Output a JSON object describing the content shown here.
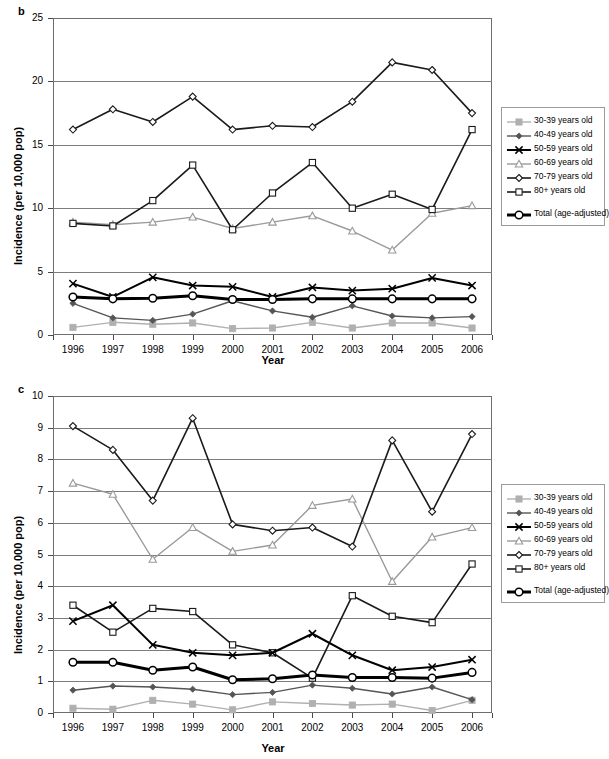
{
  "figure": {
    "panels": [
      {
        "letter": "b",
        "ylabel": "Incidence (per 10,000 pop)",
        "xlabel": "Year",
        "yticks": [
          "25",
          "20",
          "15",
          "10",
          "5",
          "0"
        ],
        "xticks": [
          "1996",
          "1997",
          "1998",
          "1999",
          "2000",
          "2001",
          "2002",
          "2003",
          "2004",
          "2005",
          "2006"
        ]
      },
      {
        "letter": "c",
        "ylabel": "Incidence (per 10,000 pop)",
        "xlabel": "Year",
        "yticks": [
          "10",
          "9",
          "8",
          "7",
          "6",
          "5",
          "4",
          "3",
          "2",
          "1",
          "0"
        ],
        "xticks": [
          "1996",
          "1997",
          "1998",
          "1999",
          "2000",
          "2001",
          "2002",
          "2003",
          "2004",
          "2005",
          "2006"
        ]
      }
    ],
    "legend": {
      "entries": [
        {
          "label": "30-39 years old",
          "marker": "filled-square",
          "color": "#b0b0b0",
          "width": 1.4
        },
        {
          "label": "40-49 years old",
          "marker": "filled-diamond",
          "color": "#555555",
          "width": 1.4
        },
        {
          "label": "50-59 years old",
          "marker": "cross-x",
          "color": "#000000",
          "width": 2.0
        },
        {
          "label": "60-69 years old",
          "marker": "open-triangle",
          "color": "#9a9a9a",
          "width": 1.4
        },
        {
          "label": "70-79 years old",
          "marker": "open-diamond",
          "color": "#1a1a1a",
          "width": 1.6
        },
        {
          "label": "80+ years old",
          "marker": "open-square",
          "color": "#1a1a1a",
          "width": 1.6
        }
      ],
      "total_entry": {
        "label": "Total (age-adjusted)",
        "marker": "open-circle",
        "color": "#000000",
        "width": 3.0
      }
    }
  },
  "chart_data": [
    {
      "type": "line",
      "panel": "b",
      "title": "",
      "xlabel": "Year",
      "ylabel": "Incidence (per 10,000 pop)",
      "categories": [
        "1996",
        "1997",
        "1998",
        "1999",
        "2000",
        "2001",
        "2002",
        "2003",
        "2004",
        "2005",
        "2006"
      ],
      "ylim": [
        0,
        25
      ],
      "ytick_step": 5,
      "grid": true,
      "legend_position": "right",
      "series": [
        {
          "name": "30-39 years old",
          "marker": "filled-square",
          "color": "#b0b0b0",
          "values": [
            0.6,
            1.0,
            0.85,
            0.95,
            0.5,
            0.55,
            1.0,
            0.55,
            0.95,
            0.95,
            0.55
          ]
        },
        {
          "name": "40-49 years old",
          "marker": "filled-diamond",
          "color": "#555555",
          "values": [
            2.5,
            1.35,
            1.15,
            1.65,
            2.7,
            1.9,
            1.4,
            2.3,
            1.5,
            1.35,
            1.45
          ]
        },
        {
          "name": "50-59 years old",
          "marker": "cross-x",
          "color": "#000000",
          "values": [
            4.05,
            3.0,
            4.55,
            3.9,
            3.8,
            3.0,
            3.75,
            3.5,
            3.65,
            4.5,
            3.9
          ]
        },
        {
          "name": "60-69 years old",
          "marker": "open-triangle",
          "color": "#9a9a9a",
          "values": [
            8.9,
            8.7,
            8.9,
            9.3,
            8.4,
            8.9,
            9.4,
            8.2,
            6.7,
            9.6,
            10.2
          ]
        },
        {
          "name": "70-79 years old",
          "marker": "open-diamond",
          "color": "#1a1a1a",
          "values": [
            16.2,
            17.8,
            16.8,
            18.8,
            16.2,
            16.5,
            16.4,
            18.4,
            21.5,
            20.9,
            17.5
          ]
        },
        {
          "name": "80+ years old",
          "marker": "open-square",
          "color": "#1a1a1a",
          "values": [
            8.8,
            8.6,
            10.6,
            13.4,
            8.3,
            11.2,
            13.6,
            10.0,
            11.1,
            9.9,
            16.2
          ]
        },
        {
          "name": "Total (age-adjusted)",
          "marker": "open-circle",
          "color": "#000000",
          "values": [
            3.0,
            2.85,
            2.9,
            3.1,
            2.8,
            2.8,
            2.85,
            2.85,
            2.85,
            2.85,
            2.85
          ]
        }
      ]
    },
    {
      "type": "line",
      "panel": "c",
      "title": "",
      "xlabel": "Year",
      "ylabel": "Incidence (per 10,000 pop)",
      "categories": [
        "1996",
        "1997",
        "1998",
        "1999",
        "2000",
        "2001",
        "2002",
        "2003",
        "2004",
        "2005",
        "2006"
      ],
      "ylim": [
        0,
        10
      ],
      "ytick_step": 1,
      "grid": true,
      "legend_position": "right",
      "series": [
        {
          "name": "30-39 years old",
          "marker": "filled-square",
          "color": "#b0b0b0",
          "values": [
            0.15,
            0.12,
            0.4,
            0.28,
            0.1,
            0.35,
            0.3,
            0.25,
            0.28,
            0.08,
            0.4
          ]
        },
        {
          "name": "40-49 years old",
          "marker": "filled-diamond",
          "color": "#555555",
          "values": [
            0.72,
            0.85,
            0.82,
            0.75,
            0.58,
            0.65,
            0.88,
            0.78,
            0.6,
            0.82,
            0.42
          ]
        },
        {
          "name": "50-59 years old",
          "marker": "cross-x",
          "color": "#000000",
          "values": [
            2.9,
            3.4,
            2.15,
            1.9,
            1.82,
            1.9,
            2.5,
            1.82,
            1.35,
            1.45,
            1.68
          ]
        },
        {
          "name": "60-69 years old",
          "marker": "open-triangle",
          "color": "#9a9a9a",
          "values": [
            7.25,
            6.9,
            4.85,
            5.85,
            5.1,
            5.3,
            6.55,
            6.75,
            4.15,
            5.55,
            5.85
          ]
        },
        {
          "name": "70-79 years old",
          "marker": "open-diamond",
          "color": "#1a1a1a",
          "values": [
            9.05,
            8.3,
            6.7,
            9.3,
            5.95,
            5.75,
            5.85,
            5.25,
            8.6,
            6.35,
            8.8
          ]
        },
        {
          "name": "80+ years old",
          "marker": "open-square",
          "color": "#1a1a1a",
          "values": [
            3.4,
            2.55,
            3.3,
            3.2,
            2.15,
            1.9,
            1.1,
            3.7,
            3.05,
            2.85,
            4.7
          ]
        },
        {
          "name": "Total (age-adjusted)",
          "marker": "open-circle",
          "color": "#000000",
          "values": [
            1.6,
            1.6,
            1.35,
            1.45,
            1.05,
            1.08,
            1.2,
            1.12,
            1.12,
            1.1,
            1.28
          ]
        }
      ]
    }
  ]
}
